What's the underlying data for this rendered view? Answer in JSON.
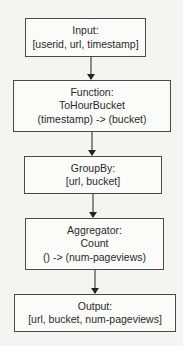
{
  "diagram": {
    "nodes": [
      {
        "id": "input",
        "lines": [
          "Input:",
          "[userid, url, timestamp]"
        ]
      },
      {
        "id": "function",
        "lines": [
          "Function:",
          "ToHourBucket",
          "(timestamp) -> (bucket)"
        ]
      },
      {
        "id": "groupby",
        "lines": [
          "GroupBy:",
          "[url, bucket]"
        ]
      },
      {
        "id": "aggregator",
        "lines": [
          "Aggregator:",
          "Count",
          "() -> (num-pageviews)"
        ]
      },
      {
        "id": "output",
        "lines": [
          "Output:",
          "[url, bucket, num-pageviews]"
        ]
      }
    ],
    "edges": [
      {
        "from": "input",
        "to": "function"
      },
      {
        "from": "function",
        "to": "groupby"
      },
      {
        "from": "groupby",
        "to": "aggregator"
      },
      {
        "from": "aggregator",
        "to": "output"
      }
    ]
  }
}
